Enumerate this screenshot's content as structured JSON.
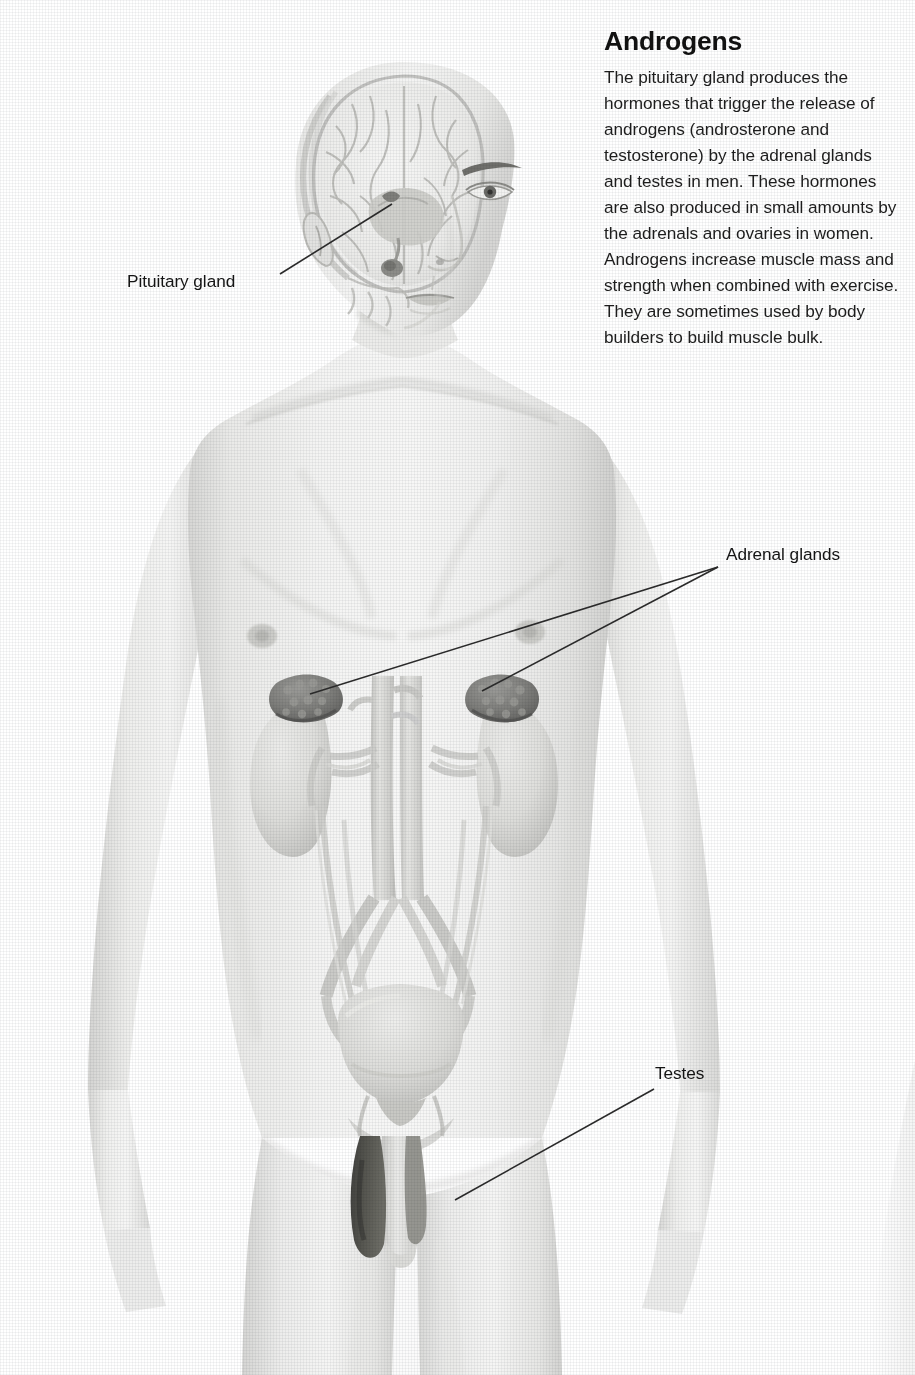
{
  "article": {
    "heading": "Androgens",
    "body": "The pituitary gland produces the hormones that trigger the release of androgens (androsterone and testosterone) by the adrenal glands and testes in men. These hormones are also produced in small amounts by the adrenals and ovaries in women. Androgens increase muscle mass and strength when combined with exercise. They are sometimes used by body builders to build muscle bulk.",
    "body_lines": [
      "The pituitary gland produces the",
      "hormones that trigger the release",
      "of androgens (androsterone and",
      "testosterone) by the adrenal glands",
      "and testes in men. These hormones",
      "are also produced in small amounts",
      "by the adrenals and ovaries in women.",
      "Androgens increase muscle mass and",
      "strength when combined with exercise.",
      "They are sometimes used by body",
      "builders to build muscle bulk."
    ]
  },
  "callouts": {
    "pituitary": "Pituitary gland",
    "adrenal": "Adrenal glands",
    "testes": "Testes"
  },
  "figure": {
    "view": "anterior full-body with head in three-quarter view",
    "cutaway": "sagittal skull cutaway revealing brain and pituitary gland",
    "organs_shown": [
      "brain",
      "pituitary gland",
      "kidneys",
      "adrenal glands",
      "aorta",
      "inferior vena cava",
      "renal arteries and veins",
      "ureters",
      "urinary bladder",
      "prostate",
      "penis",
      "testes"
    ],
    "style": "halftone screened grayscale medical illustration"
  },
  "colors": {
    "page_background": "#ffffff",
    "text": "#1b1b1b",
    "heading": "#111111",
    "leader_line": "#2b2b2b",
    "skin_light": "#f2f2f1",
    "skin_mid": "#e2e2e1",
    "skin_shadow": "#cfcfcf",
    "organ_mid": "#d8d8d6",
    "organ_dark": "#8f8f8d",
    "adrenal_dark": "#6e6e6c",
    "scrotum_dark": "#4a4a48"
  }
}
